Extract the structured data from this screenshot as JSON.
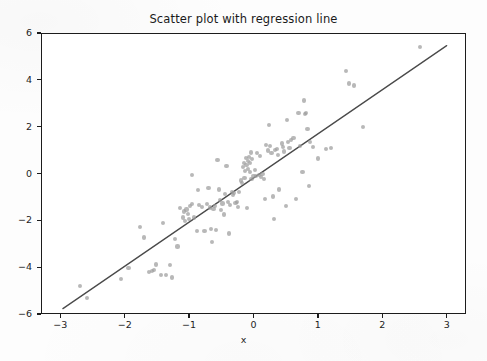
{
  "figure": {
    "width": 487,
    "height": 361,
    "background_color": "#fdfdfd",
    "axes_color": "#1c1c1c"
  },
  "chart_data": {
    "type": "scatter",
    "title": "Scatter plot with regression line",
    "xlabel": "x",
    "ylabel": "",
    "xlim": [
      -3.3,
      3.3
    ],
    "ylim": [
      -6,
      6
    ],
    "grid": false,
    "legend": null,
    "xticks": [
      -3,
      -2,
      -1,
      0,
      1,
      2,
      3
    ],
    "xtick_labels": [
      "−3",
      "−2",
      "−1",
      "0",
      "1",
      "2",
      "3"
    ],
    "yticks": [
      -6,
      -4,
      -2,
      0,
      2,
      4,
      6
    ],
    "ytick_labels": [
      "−6",
      "−4",
      "−2",
      "0",
      "2",
      "4",
      "6"
    ],
    "point_color": "#9d9d9d",
    "point_opacity": 0.72,
    "point_size": 4.2,
    "line_color": "#4a4a4a",
    "line_width": 1.3,
    "regression_line": {
      "slope": 1.885,
      "intercept": -0.19,
      "x_start": -2.96,
      "y_start": -5.77,
      "x_end": 3.0,
      "y_end": 5.46
    },
    "n_points": 122,
    "points": [
      [
        -2.7,
        -4.8
      ],
      [
        -2.58,
        -5.32
      ],
      [
        -2.06,
        -4.49
      ],
      [
        -1.94,
        -4.05
      ],
      [
        -1.76,
        -2.3
      ],
      [
        -1.7,
        -2.73
      ],
      [
        -1.62,
        -4.22
      ],
      [
        -1.58,
        -4.15
      ],
      [
        -1.55,
        -4.11
      ],
      [
        -1.52,
        -3.89
      ],
      [
        -1.44,
        -4.35
      ],
      [
        -1.4,
        -2.12
      ],
      [
        -1.36,
        -4.34
      ],
      [
        -1.3,
        -3.92
      ],
      [
        -1.26,
        -4.44
      ],
      [
        -1.22,
        -2.8
      ],
      [
        -1.18,
        -3.12
      ],
      [
        -1.14,
        -1.48
      ],
      [
        -1.1,
        -1.88
      ],
      [
        -1.08,
        -1.62
      ],
      [
        -1.06,
        -2.02
      ],
      [
        -1.04,
        -1.54
      ],
      [
        -1.02,
        -1.72
      ],
      [
        -1.0,
        -1.95
      ],
      [
        -0.98,
        -1.4
      ],
      [
        -0.96,
        -1.32
      ],
      [
        -0.95,
        -0.08
      ],
      [
        -0.92,
        -1.88
      ],
      [
        -0.88,
        -2.45
      ],
      [
        -0.86,
        -0.7
      ],
      [
        -0.84,
        -1.35
      ],
      [
        -0.8,
        -1.42
      ],
      [
        -0.76,
        -2.46
      ],
      [
        -0.72,
        -1.3
      ],
      [
        -0.7,
        -0.62
      ],
      [
        -0.68,
        -1.45
      ],
      [
        -0.66,
        -2.38
      ],
      [
        -0.64,
        -2.92
      ],
      [
        -0.62,
        -1.5
      ],
      [
        -0.6,
        -1.38
      ],
      [
        -0.58,
        -2.4
      ],
      [
        -0.56,
        0.56
      ],
      [
        -0.54,
        -0.68
      ],
      [
        -0.52,
        -1.12
      ],
      [
        -0.5,
        -1.56
      ],
      [
        -0.48,
        -1.28
      ],
      [
        -0.46,
        -1.75
      ],
      [
        -0.44,
        -0.88
      ],
      [
        -0.42,
        0.32
      ],
      [
        -0.4,
        -1.22
      ],
      [
        -0.38,
        -2.56
      ],
      [
        -0.36,
        -1.35
      ],
      [
        -0.34,
        -0.8
      ],
      [
        -0.32,
        -0.92
      ],
      [
        -0.3,
        -0.85
      ],
      [
        -0.28,
        -1.26
      ],
      [
        -0.26,
        -1.2
      ],
      [
        -0.24,
        -1.44
      ],
      [
        -0.22,
        -0.78
      ],
      [
        -0.2,
        -0.3
      ],
      [
        -0.18,
        -0.42
      ],
      [
        -0.16,
        0.26
      ],
      [
        -0.15,
        0.45
      ],
      [
        -0.14,
        -0.18
      ],
      [
        -0.13,
        0.12
      ],
      [
        -0.12,
        0.66
      ],
      [
        -0.11,
        0.38
      ],
      [
        -0.1,
        -1.48
      ],
      [
        -0.09,
        0.52
      ],
      [
        -0.08,
        0.2
      ],
      [
        -0.07,
        0.7
      ],
      [
        -0.06,
        0.06
      ],
      [
        -0.05,
        0.44
      ],
      [
        -0.04,
        0.9
      ],
      [
        -0.03,
        -0.24
      ],
      [
        -0.02,
        0.62
      ],
      [
        0.0,
        -0.12
      ],
      [
        0.02,
        0.15
      ],
      [
        0.04,
        -0.1
      ],
      [
        0.06,
        0.88
      ],
      [
        0.08,
        -0.06
      ],
      [
        0.1,
        0.74
      ],
      [
        0.12,
        -0.14
      ],
      [
        0.14,
        -0.02
      ],
      [
        0.16,
        -0.22
      ],
      [
        0.18,
        -1.08
      ],
      [
        0.2,
        1.22
      ],
      [
        0.22,
        0.98
      ],
      [
        0.24,
        2.08
      ],
      [
        0.26,
        1.18
      ],
      [
        0.28,
        0.86
      ],
      [
        0.3,
        -0.98
      ],
      [
        0.32,
        -1.94
      ],
      [
        0.34,
        1.0
      ],
      [
        0.36,
        1.06
      ],
      [
        0.38,
        0.8
      ],
      [
        0.4,
        -0.68
      ],
      [
        0.44,
        1.28
      ],
      [
        0.46,
        1.14
      ],
      [
        0.48,
        0.94
      ],
      [
        0.5,
        -1.4
      ],
      [
        0.52,
        2.3
      ],
      [
        0.54,
        1.36
      ],
      [
        0.56,
        1.1
      ],
      [
        0.58,
        1.44
      ],
      [
        0.62,
        1.52
      ],
      [
        0.66,
        -1.1
      ],
      [
        0.7,
        2.6
      ],
      [
        0.72,
        1.16
      ],
      [
        0.76,
        0.08
      ],
      [
        0.78,
        3.12
      ],
      [
        0.8,
        2.54
      ],
      [
        0.82,
        2.58
      ],
      [
        0.84,
        1.9
      ],
      [
        0.86,
        -0.52
      ],
      [
        0.88,
        1.34
      ],
      [
        0.92,
        1.12
      ],
      [
        1.0,
        0.64
      ],
      [
        1.12,
        1.04
      ],
      [
        1.2,
        1.08
      ],
      [
        1.44,
        4.36
      ],
      [
        1.48,
        3.84
      ],
      [
        1.56,
        3.76
      ],
      [
        1.7,
        2.0
      ],
      [
        2.58,
        5.4
      ]
    ]
  }
}
